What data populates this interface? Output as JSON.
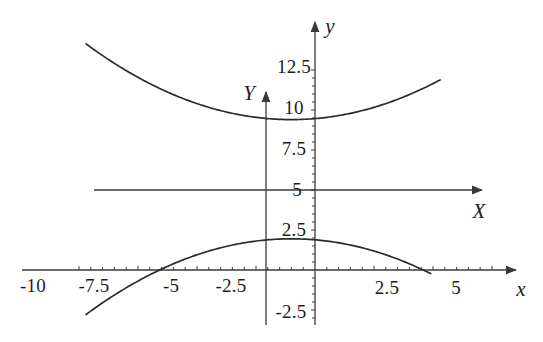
{
  "figure": {
    "background_color": "#ffffff",
    "line_color": "#2b2b2b",
    "axis_color": "#3a3a3a"
  },
  "axes": {
    "x_axis_label": "x",
    "y_axis_label": "y",
    "X_axis_label": "X",
    "Y_axis_label": "Y",
    "x_ticks": [
      "-10",
      "-7.5",
      "-5",
      "-2.5",
      "2.5",
      "5"
    ],
    "y_ticks": [
      "12.5",
      "10",
      "7.5",
      "5",
      "2.5",
      "-2.5"
    ]
  },
  "chart_data": {
    "type": "line",
    "title": "",
    "xlabel": "x",
    "ylabel": "y",
    "xlim": [
      -11.5,
      6.2
    ],
    "ylim": [
      -3.6,
      13.8
    ],
    "grid": false,
    "legend": "none",
    "secondary_axes": {
      "note": "Translated axes X and Y drawn through the point (x=0 shifted to X origin, y=5)",
      "X_axis_label": "X",
      "Y_axis_label": "Y",
      "X_axis_y_value": 5,
      "Y_axis_x_value": -2.1,
      "X_axis_x_range": [
        -9.7,
        5.3
      ],
      "Y_axis_y_range": [
        -3.4,
        11.3
      ]
    },
    "x_tick_values": [
      -10,
      -7.5,
      -5,
      -2.5,
      2.5,
      5
    ],
    "x_tick_labels": [
      "-10",
      "-7.5",
      "-5",
      "-2.5",
      "2.5",
      "5"
    ],
    "y_tick_values": [
      12.5,
      10,
      7.5,
      5,
      2.5,
      -2.5
    ],
    "y_tick_labels": [
      "12.5",
      "10",
      "7.5",
      "5",
      "2.5",
      "-2.5"
    ],
    "series": [
      {
        "name": "upper-branch",
        "kind": "parabola-opening-up",
        "vertex": [
          -1.0,
          9.4
        ],
        "coefficient": 0.0625,
        "equation": "y = 9.4 + (x + 1)^2 / 16",
        "x": [
          -9.7,
          -9.0,
          -8.0,
          -7.0,
          -6.0,
          -5.0,
          -4.0,
          -3.0,
          -2.0,
          -1.0,
          0.0,
          1.0,
          2.0,
          3.0,
          4.0,
          5.0,
          5.3
        ],
        "values": [
          14.1,
          13.4,
          12.45,
          11.65,
          11.0,
          10.4,
          9.96,
          9.65,
          9.46,
          9.4,
          9.46,
          9.65,
          9.96,
          10.4,
          11.0,
          11.65,
          11.85
        ]
      },
      {
        "name": "lower-branch",
        "kind": "parabola-opening-down",
        "vertex": [
          -1.0,
          1.95
        ],
        "coefficient": -0.0625,
        "equation": "y = 1.95 - (x + 1)^2 / 16",
        "x": [
          -9.7,
          -9.0,
          -8.0,
          -7.0,
          -6.0,
          -5.0,
          -4.0,
          -3.0,
          -2.0,
          -1.0,
          0.0,
          1.0,
          2.0,
          3.0,
          4.0,
          4.9
        ],
        "values": [
          -2.85,
          -2.05,
          -1.11,
          -0.3,
          0.39,
          0.95,
          1.39,
          1.7,
          1.89,
          1.95,
          1.89,
          1.7,
          1.39,
          0.95,
          0.39,
          -0.25
        ]
      }
    ],
    "x_intercepts_lower": [
      -6.6,
      4.6
    ],
    "annotations": []
  }
}
